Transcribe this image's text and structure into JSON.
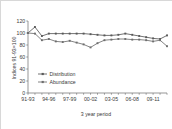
{
  "chart_data": {
    "type": "line",
    "title": "",
    "xlabel": "3 year period",
    "ylabel": "Indices 91-93=100",
    "ylim": [
      0,
      120
    ],
    "ytick_labels": [
      "0",
      "20",
      "40",
      "60",
      "80",
      "100",
      "120"
    ],
    "yticks": [
      0,
      20,
      40,
      60,
      80,
      100,
      120
    ],
    "grid": false,
    "legend_position": "inside-lower-left",
    "x": [
      "91-93",
      "92-94",
      "93-95",
      "94-96",
      "95-97",
      "96-98",
      "97-99",
      "98-00",
      "99-01",
      "00-02",
      "01-03",
      "02-04",
      "03-05",
      "04-06",
      "05-07",
      "06-08",
      "07-09",
      "08-10",
      "09-11",
      "10-12",
      "11-13"
    ],
    "xtick_labels": [
      "91-93",
      "94-96",
      "97-99",
      "00-02",
      "03-05",
      "06-08",
      "09-11"
    ],
    "xtick_indices": [
      0,
      3,
      6,
      9,
      12,
      15,
      18
    ],
    "series": [
      {
        "name": "Distribution",
        "color": "#595959",
        "marker": "square",
        "values": [
          100,
          110,
          95,
          99,
          99,
          99,
          99,
          99,
          99,
          98,
          97,
          96,
          96,
          97,
          99,
          97,
          95,
          93,
          91,
          90,
          96
        ]
      },
      {
        "name": "Abundance",
        "color": "#6e6e6e",
        "marker": "square",
        "values": [
          100,
          99,
          88,
          90,
          86,
          85,
          87,
          84,
          81,
          76,
          83,
          88,
          89,
          90,
          90,
          89,
          89,
          88,
          86,
          88,
          78
        ]
      }
    ]
  },
  "legend": {
    "items": [
      {
        "label": "Distribution"
      },
      {
        "label": "Abundance"
      }
    ]
  },
  "colors": {
    "border": "#d8d8d8",
    "axis": "#6b6b6b",
    "text": "#3a3a3a",
    "background": "#ffffff",
    "distribution": "#595959",
    "abundance": "#6e6e6e"
  }
}
